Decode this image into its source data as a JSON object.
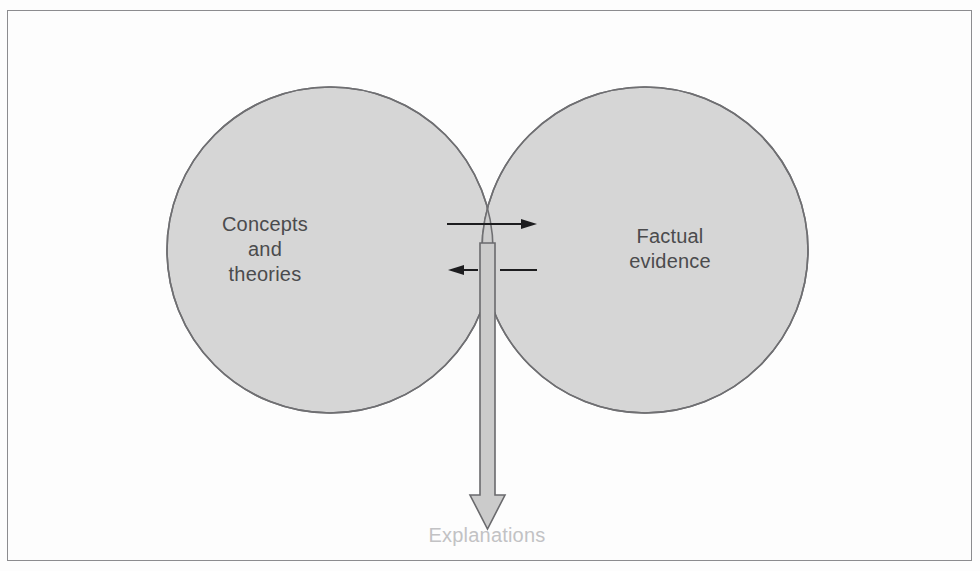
{
  "diagram": {
    "type": "venn-diagram",
    "frame": {
      "border_color": "#8c8c8f",
      "background_color": "#fdfdfd"
    },
    "circles": [
      {
        "id": "concepts",
        "label_lines": [
          "Concepts",
          "and",
          "theories"
        ],
        "label_text": "Concepts and theories",
        "fill_color": "#d6d6d6",
        "stroke_color": "#6f6f72",
        "center_x": 330,
        "center_y": 250,
        "radius": 163
      },
      {
        "id": "evidence",
        "label_lines": [
          "Factual",
          "evidence"
        ],
        "label_text": "Factual evidence",
        "fill_color": "#d6d6d6",
        "stroke_color": "#6f6f72",
        "center_x": 645,
        "center_y": 250,
        "radius": 163
      }
    ],
    "overlap": {
      "fill_color": "#cfcfcf",
      "description": "intersection lens between concepts and factual evidence"
    },
    "arrows": {
      "right_arrow": {
        "name": "concepts-to-evidence-arrow",
        "direction": "right",
        "color": "#1d1d1f",
        "x_start": 447,
        "x_end": 537,
        "y": 224
      },
      "left_arrow": {
        "name": "evidence-to-concepts-arrow",
        "direction": "left",
        "color": "#1d1d1f",
        "x_start": 537,
        "x_end": 448,
        "y": 270
      },
      "down_arrow": {
        "name": "explanations-arrow",
        "direction": "down",
        "fill_color": "#cbcbcb",
        "stroke_color": "#6a6a6d",
        "x_center": 487,
        "y_top": 243,
        "y_tip": 529,
        "shaft_width": 15,
        "head_width": 36
      }
    },
    "explanations": {
      "label": "Explanations",
      "color": "#c2c2c4"
    }
  }
}
